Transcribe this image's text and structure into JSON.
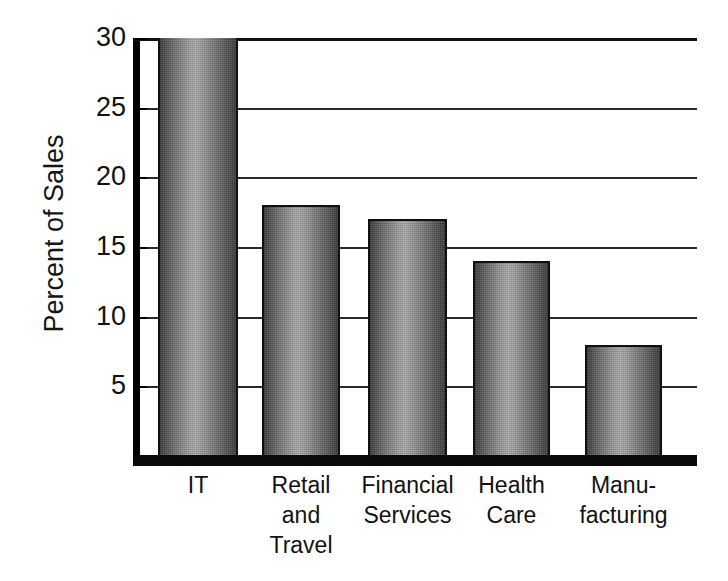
{
  "chart_data": {
    "type": "bar",
    "title": "",
    "subtitle": "",
    "xlabel": "",
    "ylabel": "Percent of Sales",
    "categories": [
      "IT",
      "Retail and Travel",
      "Financial Services",
      "Health Care",
      "Manufacturing"
    ],
    "category_label_lines": [
      [
        "IT"
      ],
      [
        "Retail",
        "and",
        "Travel"
      ],
      [
        "Financial",
        "Services"
      ],
      [
        "Health",
        "Care"
      ],
      [
        "Manu-",
        "facturing"
      ]
    ],
    "values": [
      30,
      18,
      17,
      14,
      8
    ],
    "ylim": [
      0,
      30
    ],
    "yticks": [
      5,
      10,
      15,
      20,
      25,
      30
    ],
    "ytick_labels": [
      "5",
      "10",
      "15",
      "20",
      "25",
      "30"
    ],
    "grid": true,
    "grid_axis": "y",
    "legend": false,
    "legend_position": "none",
    "bar_fill_style": "gradient-grayscale",
    "colors": {
      "bar_edge_dark": "#3f3f3f",
      "bar_center_light": "#aeaeae",
      "bar_outline": "#101010",
      "axis": "#000000",
      "gridline": "#2a2a2a",
      "text": "#121212",
      "background": "#ffffff"
    },
    "value_unit": "percent"
  }
}
